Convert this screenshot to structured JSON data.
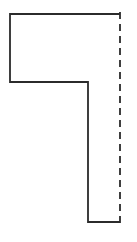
{
  "figure": {
    "background_color": "#ffffff",
    "width": 137,
    "height": 242
  },
  "chart_data": {
    "type": "line",
    "xlabel": "",
    "ylabel": "",
    "grid": false,
    "legend": false,
    "xlim": [
      0,
      137
    ],
    "ylim": [
      242,
      0
    ],
    "series": [
      {
        "name": "profile-outline",
        "style": "solid",
        "color": "#2b2b2b",
        "stroke_width": 1.8,
        "closed": false,
        "points": [
          [
            120,
            14
          ],
          [
            10,
            14
          ],
          [
            10,
            82
          ],
          [
            88,
            82
          ],
          [
            88,
            222
          ],
          [
            120,
            222
          ]
        ]
      },
      {
        "name": "axis-centerline",
        "style": "dashed",
        "color": "#2b2b2b",
        "stroke_width": 1.8,
        "dash_length": 7,
        "gap_length": 5,
        "points": [
          [
            120,
            12
          ],
          [
            120,
            228
          ]
        ]
      }
    ]
  }
}
